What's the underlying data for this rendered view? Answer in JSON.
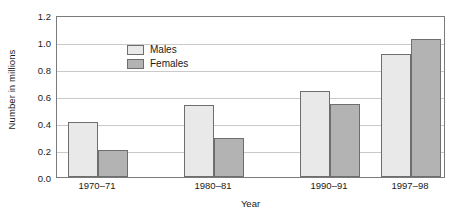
{
  "chart_data": {
    "type": "bar",
    "title": "",
    "xlabel": "Year",
    "ylabel": "Number in millions",
    "categories": [
      "1970–71",
      "1980–81",
      "1990–91",
      "1997–98"
    ],
    "category_positions": [
      1970.5,
      1980.5,
      1990.5,
      1997.5
    ],
    "series": [
      {
        "name": "Males",
        "color": "#e9e9e9",
        "values": [
          0.41,
          0.53,
          0.64,
          0.91
        ]
      },
      {
        "name": "Females",
        "color": "#b3b3b3",
        "values": [
          0.2,
          0.29,
          0.54,
          1.02
        ]
      }
    ],
    "ylim": [
      0.0,
      1.2
    ],
    "ytick_labels": [
      "0.0",
      "0.2",
      "0.4",
      "0.6",
      "0.8",
      "1.0",
      "1.2"
    ],
    "ytick_values": [
      0.0,
      0.2,
      0.4,
      0.6,
      0.8,
      1.0,
      1.2
    ],
    "grid": true,
    "legend_position": "top-left",
    "bar_edge_color": "#6e6e6e",
    "axis_color": "#7a7a7a",
    "grid_color": "#c9c9c9"
  }
}
